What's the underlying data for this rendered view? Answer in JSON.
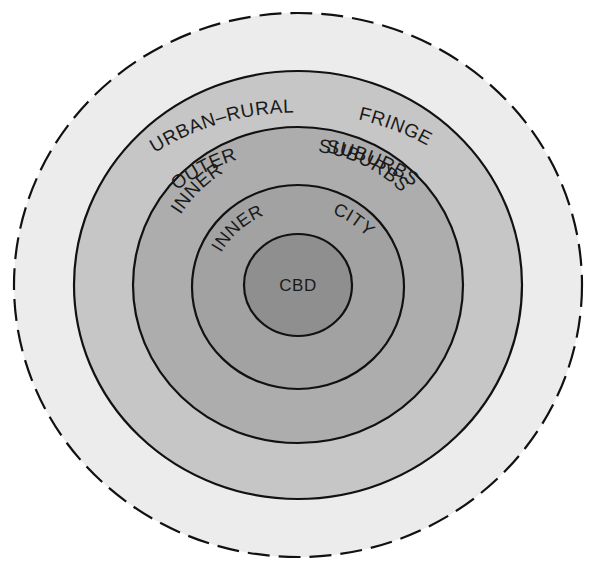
{
  "diagram": {
    "type": "concentric-zones",
    "center": {
      "x": 298,
      "y": 285
    },
    "zones": [
      {
        "id": "urban-rural-fringe",
        "label_parts": [
          "URBAN–RURAL",
          "FRINGE"
        ],
        "rx": 284,
        "ry": 272,
        "fill": "#ececec",
        "border": "dashed"
      },
      {
        "id": "outer-suburbs",
        "label_parts": [
          "OUTER",
          "SUBURBS"
        ],
        "rx": 224,
        "ry": 214,
        "fill": "#c6c6c6",
        "border": "solid"
      },
      {
        "id": "inner-suburbs",
        "label_parts": [
          "INNER",
          "SUBURBS"
        ],
        "rx": 165,
        "ry": 158,
        "fill": "#adadad",
        "border": "solid"
      },
      {
        "id": "inner-city",
        "label_parts": [
          "INNER",
          "CITY"
        ],
        "rx": 106,
        "ry": 102,
        "fill": "#a2a2a2",
        "border": "solid"
      },
      {
        "id": "cbd",
        "label_parts": [
          "CBD"
        ],
        "rx": 54,
        "ry": 51,
        "fill": "#8f8f8f",
        "border": "solid"
      }
    ],
    "labels": {
      "fringe_a": "URBAN–RURAL",
      "fringe_b": "FRINGE",
      "outer_a": "OUTER",
      "outer_b": "SUBURBS",
      "inner_sub_a": "INNER",
      "inner_sub_b": "SUBURBS",
      "inner_city_a": "INNER",
      "inner_city_b": "CITY",
      "cbd": "CBD"
    }
  }
}
